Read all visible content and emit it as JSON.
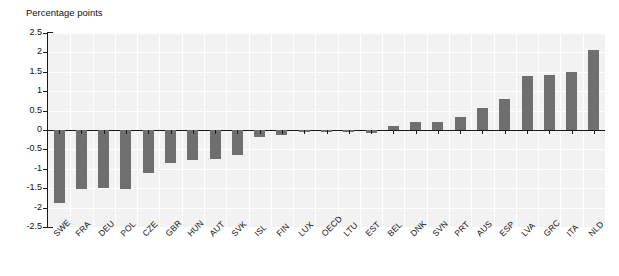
{
  "chart": {
    "type": "bar",
    "axis_title": "Percentage points",
    "bar_color": "#6f6f6f",
    "plot_background": "#f2f2f2",
    "gridline_color": "#ffffff",
    "axis_color": "#1a1a1a"
  },
  "chart_data": {
    "type": "bar",
    "title": "",
    "subtitle": "",
    "xlabel": "",
    "ylabel": "Percentage points",
    "ylim": [
      -2.5,
      2.5
    ],
    "yticks": [
      2.5,
      2,
      1.5,
      1,
      0.5,
      0,
      -0.5,
      -1,
      -1.5,
      -2,
      -2.5
    ],
    "ytick_labels": [
      "2.5",
      "2",
      "1.5",
      "1",
      "0.5",
      "0",
      "-0.5",
      "-1",
      "-1.5",
      "-2",
      "-2.5"
    ],
    "grid": true,
    "legend": "none",
    "categories": [
      "SWE",
      "FRA",
      "DEU",
      "POL",
      "CZE",
      "GBR",
      "HUN",
      "AUT",
      "SVK",
      "ISL",
      "FIN",
      "LUX",
      "OECD",
      "LTU",
      "EST",
      "BEL",
      "DNK",
      "SVN",
      "PRT",
      "AUS",
      "ESP",
      "LVA",
      "GRC",
      "ITA",
      "NLD"
    ],
    "values": [
      -1.88,
      -1.52,
      -1.5,
      -1.52,
      -1.1,
      -0.85,
      -0.77,
      -0.74,
      -0.65,
      -0.18,
      -0.12,
      -0.06,
      -0.04,
      -0.05,
      -0.07,
      0.1,
      0.21,
      0.2,
      0.33,
      0.56,
      0.79,
      1.4,
      1.43,
      1.5,
      2.05
    ]
  }
}
